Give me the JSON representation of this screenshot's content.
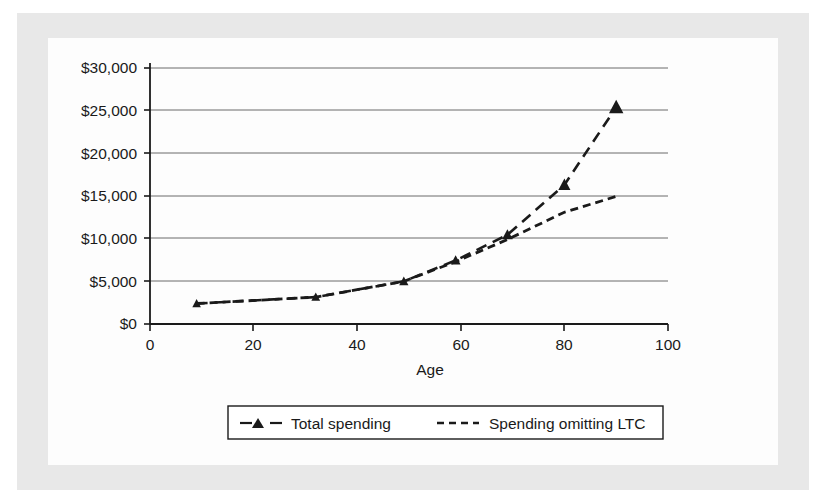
{
  "figure": {
    "background_color": "#ffffff",
    "frame_color": "#e8e8e8",
    "canvas_color": "#fdfdfd",
    "ink_color": "#1a1a1a",
    "grid_color": "#6b6b6b"
  },
  "chart_data": {
    "type": "line",
    "title": "",
    "subtitle": "",
    "xlabel": "Age",
    "ylabel": "",
    "xlim": [
      0,
      100
    ],
    "ylim": [
      0,
      30000
    ],
    "grid": true,
    "grid_axis": "y",
    "legend_position": "bottom",
    "x_ticks": [
      0,
      20,
      40,
      60,
      80,
      100
    ],
    "x_tick_labels": [
      "0",
      "20",
      "40",
      "60",
      "80",
      "100"
    ],
    "y_ticks": [
      0,
      5000,
      10000,
      15000,
      20000,
      25000,
      30000
    ],
    "y_tick_labels": [
      "$0",
      "$5,000",
      "$10,000",
      "$15,000",
      "$20,000",
      "$25,000",
      "$30,000"
    ],
    "series": [
      {
        "name": "Total spending",
        "marker": "triangle",
        "linestyle": "dashed",
        "color": "#1a1a1a",
        "x": [
          9,
          32,
          49,
          59,
          69,
          80,
          90
        ],
        "values": [
          2400,
          3150,
          5000,
          7450,
          10450,
          16300,
          25400
        ]
      },
      {
        "name": "Spending omitting LTC",
        "marker": "none",
        "linestyle": "dotted",
        "color": "#1a1a1a",
        "x": [
          9,
          32,
          49,
          59,
          69,
          80,
          90
        ],
        "values": [
          2400,
          3150,
          5000,
          7300,
          9900,
          13100,
          14950
        ]
      }
    ]
  },
  "legend": {
    "entries": [
      {
        "label": "Total spending",
        "style": "dashed-with-triangle"
      },
      {
        "label": "Spending omitting LTC",
        "style": "dotted"
      }
    ]
  },
  "axis": {
    "x_title": "Age"
  }
}
